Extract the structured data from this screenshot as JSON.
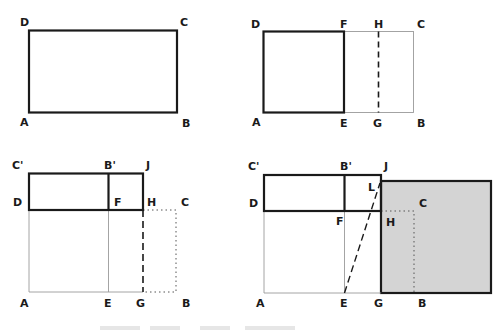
{
  "figure": {
    "colors": {
      "stroke": "#1a1a1a",
      "thin": "#9a9a9a",
      "shade": "#d4d4d4"
    },
    "panel1": {
      "labels": {
        "D": "D",
        "C": "C",
        "A": "A",
        "B": "B"
      }
    },
    "panel2": {
      "labels": {
        "D": "D",
        "F": "F",
        "H": "H",
        "C": "C",
        "A": "A",
        "E": "E",
        "G": "G",
        "B": "B"
      }
    },
    "panel3": {
      "labels": {
        "C_prime": "C'",
        "B_prime": "B'",
        "J": "J",
        "D": "D",
        "F": "F",
        "H": "H",
        "C": "C",
        "A": "A",
        "E": "E",
        "G": "G",
        "B": "B"
      }
    },
    "panel4": {
      "labels": {
        "C_prime": "C'",
        "B_prime": "B'",
        "J": "J",
        "L": "L",
        "D": "D",
        "C": "C",
        "F": "F",
        "H": "H",
        "A": "A",
        "E": "E",
        "G": "G",
        "B": "B"
      }
    }
  }
}
